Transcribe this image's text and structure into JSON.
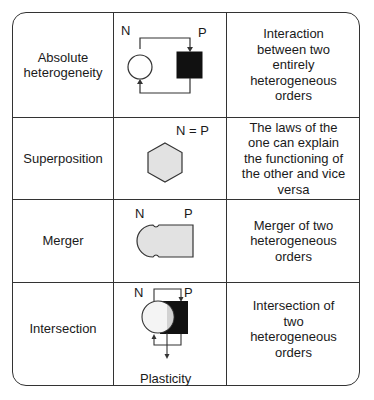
{
  "table": {
    "rows": [
      {
        "name": "Absolute heterogeneity",
        "diagram": {
          "type": "circle-square-feedback",
          "left_label": "N",
          "right_label": "P"
        },
        "description": "Interaction between two entirely heterogeneous orders"
      },
      {
        "name": "Superposition",
        "diagram": {
          "type": "hexagon",
          "label": "N = P"
        },
        "description": "The laws of the one can explain the functioning of the other and vice versa"
      },
      {
        "name": "Merger",
        "diagram": {
          "type": "merged-shape",
          "left_label": "N",
          "right_label": "P"
        },
        "description": "Merger of two heterogeneous orders"
      },
      {
        "name": "Intersection",
        "diagram": {
          "type": "overlapping-circle-square",
          "left_label": "N",
          "right_label": "P",
          "bottom_label": "Plasticity"
        },
        "description": "Intersection of two heterogeneous orders"
      }
    ]
  },
  "colors": {
    "line": "#333333",
    "fill_black": "#111111",
    "fill_gray": "#e2e2e2",
    "fill_white": "#ffffff"
  }
}
